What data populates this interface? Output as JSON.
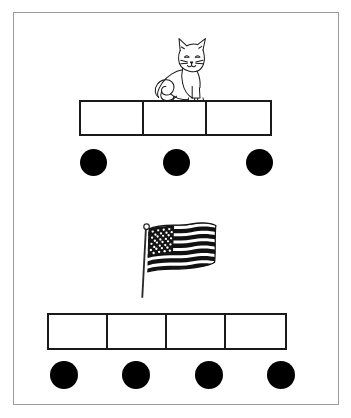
{
  "page": {
    "background_color": "#ffffff",
    "frame_border_color": "#9a9a9a",
    "ink_color": "#000000"
  },
  "items": [
    {
      "id": "cat",
      "picture_icon": "cat-icon",
      "picture_label": "cat",
      "box_count": 3,
      "boxes": [
        "",
        "",
        ""
      ],
      "dot_count": 3,
      "dot_color": "#000000",
      "box_border_color": "#1a1a1a",
      "box_fill_color": "#ffffff"
    },
    {
      "id": "flag",
      "picture_icon": "american-flag-icon",
      "picture_label": "flag",
      "box_count": 4,
      "boxes": [
        "",
        "",
        "",
        ""
      ],
      "dot_count": 4,
      "dot_color": "#000000",
      "box_border_color": "#1a1a1a",
      "box_fill_color": "#ffffff"
    }
  ]
}
